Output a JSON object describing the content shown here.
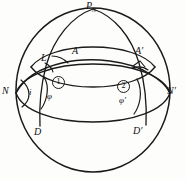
{
  "figure": {
    "type": "geometry-diagram",
    "background_color": "#fdfdfc",
    "stroke_color": "#1a1a1a"
  },
  "labels": {
    "pole": {
      "base": "P",
      "sub": "N",
      "x": 88,
      "y": 3
    },
    "point_L": {
      "text": "L",
      "x": 41,
      "y": 54
    },
    "point_A": {
      "text": "A",
      "x": 73,
      "y": 47
    },
    "point_A_prime": {
      "text": "A′",
      "x": 137,
      "y": 48
    },
    "point_N": {
      "text": "N",
      "x": 2,
      "y": 88
    },
    "point_N_prime": {
      "text": "N′",
      "x": 166,
      "y": 88
    },
    "point_D": {
      "text": "D",
      "x": 35,
      "y": 128
    },
    "point_D_prime": {
      "text": "D′",
      "x": 134,
      "y": 127
    },
    "angle_i": {
      "text": "i",
      "x": 28,
      "y": 89
    },
    "angle_phi": {
      "text": "φ",
      "x": 47,
      "y": 93
    },
    "angle_phi_prime": {
      "text": "φ′",
      "x": 120,
      "y": 97
    },
    "marker_one": {
      "text": "①",
      "value": "1",
      "x": 52,
      "y": 77
    },
    "marker_two": {
      "text": "②",
      "value": "2",
      "x": 118,
      "y": 81
    }
  },
  "geometry": {
    "sphere_outline": {
      "cx": 93,
      "cy": 90,
      "rx": 77,
      "ry": 82
    },
    "equator_label": "equator-ellipse",
    "horizon_label": "horizon-ellipse",
    "meridian_L_label": "meridian-through-L",
    "meridian_A_label": "meridian-through-A-prime",
    "great_circle_label": "oblique-great-circle"
  }
}
